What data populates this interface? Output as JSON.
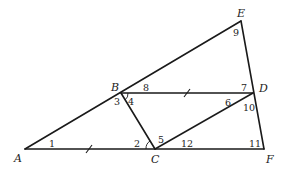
{
  "diagram": {
    "type": "geometry",
    "points": [
      {
        "label": "A",
        "x": 25,
        "y": 149
      },
      {
        "label": "B",
        "x": 121,
        "y": 93
      },
      {
        "label": "C",
        "x": 155,
        "y": 149
      },
      {
        "label": "D",
        "x": 253,
        "y": 93
      },
      {
        "label": "E",
        "x": 241,
        "y": 21
      },
      {
        "label": "F",
        "x": 264,
        "y": 149
      }
    ],
    "segments": [
      "AE",
      "AF",
      "EF",
      "BD",
      "BC",
      "CD"
    ],
    "angles": [
      "1",
      "2",
      "3",
      "4",
      "5",
      "6",
      "7",
      "8",
      "9",
      "10",
      "11",
      "12"
    ],
    "congruence_marks": [
      "AC",
      "BD"
    ],
    "marked_arcs": [
      "angle-4",
      "angle-2-5 at C"
    ]
  }
}
